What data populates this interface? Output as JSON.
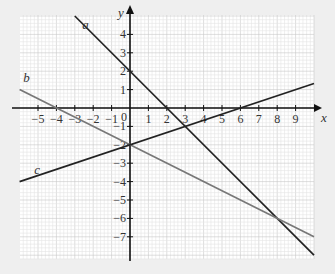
{
  "chart_data": {
    "type": "line",
    "title": "",
    "xlabel": "x",
    "ylabel": "y",
    "xlim": [
      -6,
      10
    ],
    "ylim": [
      -8,
      5
    ],
    "grid": true,
    "x_ticks": [
      -5,
      -4,
      -3,
      -2,
      -1,
      1,
      2,
      3,
      4,
      5,
      6,
      7,
      8,
      9
    ],
    "y_ticks": [
      4,
      3,
      2,
      1,
      -1,
      -2,
      -3,
      -4,
      -5,
      -6,
      -7
    ],
    "origin_label": "0",
    "series": [
      {
        "name": "a",
        "equation": "y = -x + 2",
        "x": [
          -3,
          10
        ],
        "y": [
          5,
          -8
        ],
        "color": "#222222"
      },
      {
        "name": "b",
        "equation": "y = -0.5x - 2",
        "x": [
          -6,
          10
        ],
        "y": [
          1,
          -7
        ],
        "color": "#777777"
      },
      {
        "name": "c",
        "equation": "y = x/3 - 2",
        "x": [
          -6,
          10
        ],
        "y": [
          -4,
          1.333
        ],
        "color": "#222222"
      }
    ],
    "line_labels": [
      {
        "text": "a",
        "x": -2.6,
        "y": 4.3
      },
      {
        "text": "b",
        "x": -5.8,
        "y": 1.4
      },
      {
        "text": "c",
        "x": -5.2,
        "y": -3.6
      }
    ]
  }
}
